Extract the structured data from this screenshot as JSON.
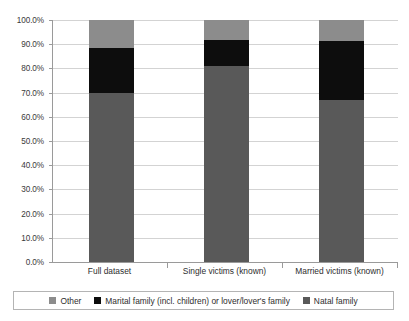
{
  "chart_data": {
    "type": "bar",
    "subtype": "stacked-100-percent",
    "title": "",
    "subtitle": "",
    "xlabel": "",
    "ylabel": "",
    "categories": [
      "Full dataset",
      "Single victims (known)",
      "Married victims (known)"
    ],
    "series": [
      {
        "name": "Natal family",
        "color": "#595959",
        "values": [
          70.0,
          81.0,
          67.0
        ],
        "value_labels": [
          "70.0%",
          "81.0%",
          "67.0%"
        ]
      },
      {
        "name": "Marital family (incl. children) or lover/lover's family",
        "color": "#0d0d0d",
        "values": [
          18.5,
          10.7,
          24.5
        ],
        "value_labels": [
          "18.5%",
          "10.7%",
          "24.5%"
        ]
      },
      {
        "name": "Other",
        "color": "#8c8c8c",
        "values": [
          11.5,
          8.3,
          8.5
        ],
        "value_labels": [
          "11.5%",
          "8.3%",
          "8.5%"
        ]
      }
    ],
    "ylim": [
      0,
      100
    ],
    "ytick_values": [
      0,
      10,
      20,
      30,
      40,
      50,
      60,
      70,
      80,
      90,
      100
    ],
    "ytick_labels": [
      "0.0%",
      "10.0%",
      "20.0%",
      "30.0%",
      "40.0%",
      "50.0%",
      "60.0%",
      "70.0%",
      "80.0%",
      "90.0%",
      "100.0%"
    ],
    "grid": true,
    "grid_axis": "y",
    "legend_position": "bottom",
    "legend_entries": [
      {
        "label": "Other",
        "color": "#8c8c8c"
      },
      {
        "label": "Marital family (incl. children) or lover/lover's family",
        "color": "#0d0d0d"
      },
      {
        "label": "Natal family",
        "color": "#595959"
      }
    ]
  },
  "colors": {
    "background": "#ffffff",
    "gridline": "#d3d3d3",
    "axis": "#9a9a9a",
    "text": "#2e2e2e",
    "legend_border": "#b4b4b4",
    "natal_family": "#595959",
    "marital_family": "#0d0d0d",
    "other": "#8c8c8c"
  }
}
